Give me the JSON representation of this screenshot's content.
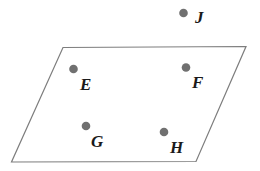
{
  "figure": {
    "type": "geometry-diagram",
    "background_color": "#ffffff",
    "width": 260,
    "height": 171
  },
  "shape": {
    "name": "parallelogram",
    "stroke_color": "#7d7d7d",
    "stroke_width": 1.2,
    "fill": "none",
    "vertices": [
      {
        "name": "top-left",
        "x": 63,
        "y": 47.5
      },
      {
        "name": "top-right",
        "x": 246,
        "y": 46.5
      },
      {
        "name": "bottom-right",
        "x": 196,
        "y": 161.5
      },
      {
        "name": "bottom-left",
        "x": 11.5,
        "y": 162
      }
    ],
    "path": "M 63 47.5 L 246 46.5 L 196 161.5 L 11.5 162 Z"
  },
  "points": [
    {
      "id": "E",
      "label": "E",
      "dot_x": 73.5,
      "dot_y": 69,
      "radius": 4.3,
      "label_x": 80,
      "label_y": 76,
      "inside_shape": true
    },
    {
      "id": "F",
      "label": "F",
      "dot_x": 186,
      "dot_y": 67.5,
      "radius": 4.3,
      "label_x": 192,
      "label_y": 74,
      "inside_shape": true
    },
    {
      "id": "G",
      "label": "G",
      "dot_x": 86,
      "dot_y": 126,
      "radius": 4.3,
      "label_x": 91,
      "label_y": 133,
      "inside_shape": true
    },
    {
      "id": "H",
      "label": "H",
      "dot_x": 164,
      "dot_y": 132,
      "radius": 4.3,
      "label_x": 170,
      "label_y": 139,
      "inside_shape": true
    },
    {
      "id": "J",
      "label": "J",
      "dot_x": 183.5,
      "dot_y": 13,
      "radius": 4.3,
      "label_x": 195,
      "label_y": 9,
      "inside_shape": false
    }
  ],
  "colors": {
    "dot_fill": "#707070",
    "outline": "#7d7d7d",
    "label_text": "#1a1a1a"
  }
}
